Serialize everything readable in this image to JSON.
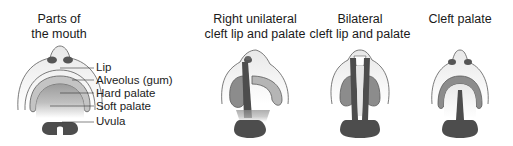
{
  "panels": [
    {
      "id": "normal",
      "title_lines": [
        "Parts of",
        "the mouth"
      ],
      "labels": [
        "Lip",
        "Alveolus (gum)",
        "Hard palate",
        "Soft palate",
        "Uvula"
      ]
    },
    {
      "id": "right-unilateral",
      "title_lines": [
        "Right unilateral",
        "cleft lip and palate"
      ]
    },
    {
      "id": "bilateral",
      "title_lines": [
        "Bilateral",
        "cleft lip and palate"
      ]
    },
    {
      "id": "cleft-palate",
      "title_lines": [
        "Cleft palate"
      ]
    }
  ],
  "colors": {
    "outline": "#5a5a5a",
    "lip_fill": "#e6e6e6",
    "gum_fill": "#c4c4c4",
    "palate_fill": "#8c8c8c",
    "dark_fill": "#4d4d4d"
  }
}
